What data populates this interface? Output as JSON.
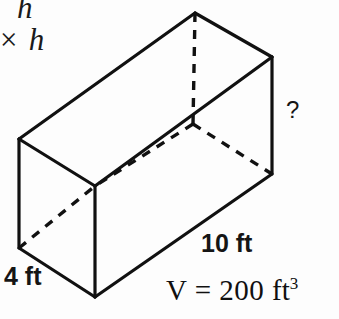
{
  "figure": {
    "type": "rectangular-prism-volume-problem",
    "background_color": "#fdfdfd",
    "stroke_color": "#111111",
    "edge_stroke_width": 3.2,
    "hidden_edge_stroke_width": 3.4,
    "hidden_edge_dash": "9 8"
  },
  "formula_fragment": {
    "line1": "h",
    "line2": "× h"
  },
  "labels": {
    "depth": "4 ft",
    "length": "10 ft",
    "height_unknown": "?",
    "volume_var": "V",
    "volume_equals": "=",
    "volume_value": "200",
    "volume_unit": "ft",
    "volume_exponent": "3"
  },
  "geometry": {
    "vertices": {
      "front_top_near": [
        95,
        186
      ],
      "front_bottom_near": [
        95,
        297
      ],
      "left_back_top": [
        19,
        139
      ],
      "left_back_bottom": [
        19,
        248
      ],
      "top_back_far": [
        195,
        13
      ],
      "right_top": [
        272,
        57
      ],
      "right_bottom": [
        272,
        174
      ],
      "hidden_back_bottom": [
        193,
        124
      ]
    },
    "solid_edges": [
      [
        [
          19,
          139
        ],
        [
          95,
          186
        ]
      ],
      [
        [
          19,
          139
        ],
        [
          19,
          248
        ]
      ],
      [
        [
          19,
          248
        ],
        [
          95,
          297
        ]
      ],
      [
        [
          95,
          186
        ],
        [
          95,
          297
        ]
      ],
      [
        [
          19,
          139
        ],
        [
          195,
          13
        ]
      ],
      [
        [
          195,
          13
        ],
        [
          272,
          57
        ]
      ],
      [
        [
          272,
          57
        ],
        [
          272,
          174
        ]
      ],
      [
        [
          95,
          186
        ],
        [
          272,
          57
        ]
      ],
      [
        [
          95,
          297
        ],
        [
          272,
          174
        ]
      ]
    ],
    "hidden_edges": [
      [
        [
          195,
          13
        ],
        [
          193,
          124
        ]
      ],
      [
        [
          193,
          124
        ],
        [
          95,
          186
        ]
      ],
      [
        [
          193,
          124
        ],
        [
          272,
          174
        ]
      ],
      [
        [
          19,
          248
        ],
        [
          95,
          186
        ]
      ]
    ]
  }
}
